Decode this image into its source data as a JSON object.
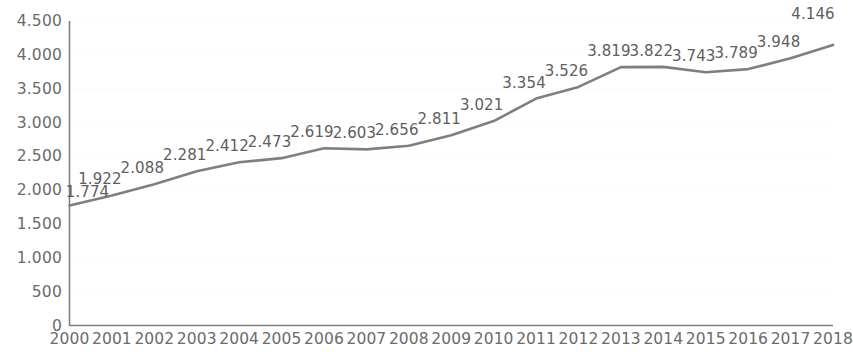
{
  "chart_data": {
    "type": "line",
    "title": "",
    "xlabel": "",
    "ylabel": "",
    "grid": true,
    "legend": "none",
    "ylim": [
      0,
      4500
    ],
    "ytick_labels": [
      "4.500",
      "4.000",
      "3.500",
      "3.000",
      "2.500",
      "2.000",
      "1.500",
      "1.000",
      "500",
      "0"
    ],
    "ytick_values": [
      4500,
      4000,
      3500,
      3000,
      2500,
      2000,
      1500,
      1000,
      500,
      0
    ],
    "categories": [
      "2000",
      "2001",
      "2002",
      "2003",
      "2004",
      "2005",
      "2006",
      "2007",
      "2008",
      "2009",
      "2010",
      "2011",
      "2012",
      "2013",
      "2014",
      "2015",
      "2016",
      "2017",
      "2018"
    ],
    "values": [
      1774,
      1922,
      2088,
      2281,
      2412,
      2473,
      2619,
      2603,
      2656,
      2811,
      3021,
      3354,
      3526,
      3819,
      3822,
      3743,
      3789,
      3948,
      4146
    ],
    "point_labels": [
      "1.774",
      "1.922",
      "2.088",
      "2.281",
      "2.412",
      "2.473",
      "2.619",
      "2.603",
      "2.656",
      "2.811",
      "3.021",
      "3.354",
      "3.526",
      "3.819",
      "3.822",
      "3.743",
      "3.789",
      "3.948",
      "4.146"
    ],
    "series": [
      {
        "name": "",
        "values": [
          1774,
          1922,
          2088,
          2281,
          2412,
          2473,
          2619,
          2603,
          2656,
          2811,
          3021,
          3354,
          3526,
          3819,
          3822,
          3743,
          3789,
          3948,
          4146
        ],
        "color": "#7f7f7f"
      }
    ],
    "colors": {
      "line": "#7f7f7f",
      "axis": "#808080",
      "tick_text": "#6b6b6b",
      "label_text": "#5e5e5e",
      "grid": "#fbfbfb",
      "background": "#ffffff"
    }
  }
}
